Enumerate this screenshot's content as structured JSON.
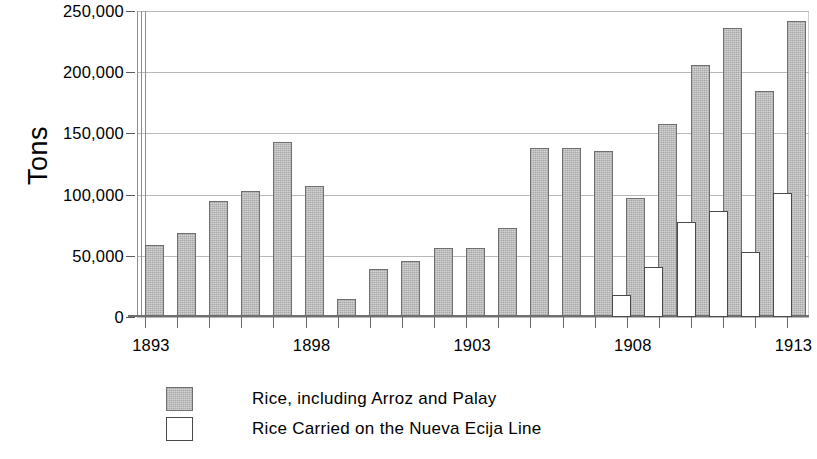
{
  "chart_data": {
    "type": "bar",
    "title": "",
    "xlabel": "",
    "ylabel": "Tons",
    "ylim": [
      0,
      250000
    ],
    "grid": true,
    "legend_position": "bottom-left",
    "y_ticks": [
      "0",
      "50,000",
      "100,000",
      "150,000",
      "200,000",
      "250,000"
    ],
    "y_tick_values": [
      0,
      50000,
      100000,
      150000,
      200000,
      250000
    ],
    "x_tick_labels": [
      "1893",
      "1898",
      "1903",
      "1908",
      "1913"
    ],
    "x_tick_values": [
      1893,
      1898,
      1903,
      1908,
      1913
    ],
    "categories": [
      "1893",
      "1894",
      "1895",
      "1896",
      "1897",
      "1898",
      "1899",
      "1900",
      "1901",
      "1902",
      "1903",
      "1904",
      "1905",
      "1906",
      "1907",
      "1908",
      "1909",
      "1910",
      "1911",
      "1912",
      "1913"
    ],
    "series": [
      {
        "name": "Rice, including Arroz and Palay",
        "color": "#b5b5b5",
        "values": [
          59000,
          69000,
          95000,
          103000,
          143000,
          107000,
          15000,
          39000,
          46000,
          56000,
          56000,
          73000,
          138000,
          138000,
          136000,
          97000,
          158000,
          206000,
          236000,
          185000,
          242000
        ]
      },
      {
        "name": "Rice Carried on the Nueva Ecija Line",
        "color": "#ffffff",
        "values": [
          null,
          null,
          null,
          null,
          null,
          null,
          null,
          null,
          null,
          null,
          null,
          null,
          null,
          null,
          null,
          18000,
          41000,
          78000,
          87000,
          53000,
          101000
        ]
      }
    ]
  },
  "legend": {
    "items": [
      {
        "label": "Rice, including Arroz and Palay",
        "swatch": "gray"
      },
      {
        "label": "Rice Carried on the Nueva Ecija Line",
        "swatch": "white"
      }
    ]
  },
  "axis": {
    "y_title": "Tons"
  }
}
